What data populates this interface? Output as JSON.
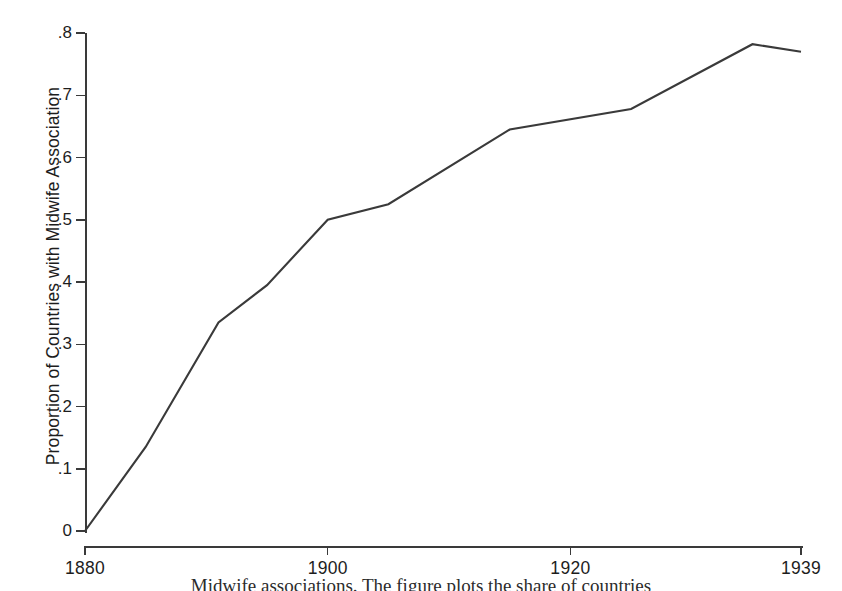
{
  "figure": {
    "background_color": "#ffffff",
    "line_color": "#3a3a3a",
    "axis_color": "#3a3a3a",
    "caption_partial": "Midwife associations. The figure plots the share of countries"
  },
  "chart_data": {
    "type": "line",
    "title": "",
    "xlabel": "",
    "ylabel": "Proportion of Countries with Midwife Association",
    "xlim": [
      1880,
      1939
    ],
    "ylim": [
      0,
      0.8
    ],
    "grid": false,
    "legend": null,
    "x_tick_labels": [
      "1880",
      "1900",
      "1920",
      "1939"
    ],
    "x_tick_values": [
      1880,
      1900,
      1920,
      1939
    ],
    "y_tick_labels": [
      "0",
      ".1",
      ".2",
      ".3",
      ".4",
      ".5",
      ".6",
      ".7",
      ".8"
    ],
    "y_tick_values": [
      0,
      0.1,
      0.2,
      0.3,
      0.4,
      0.5,
      0.6,
      0.7,
      0.8
    ],
    "series": [
      {
        "name": "Proportion of countries with midwife association",
        "x": [
          1880,
          1885,
          1891,
          1895,
          1900,
          1905,
          1915,
          1925,
          1935,
          1939
        ],
        "values": [
          0.0,
          0.135,
          0.335,
          0.395,
          0.5,
          0.525,
          0.645,
          0.678,
          0.782,
          0.77
        ]
      }
    ]
  }
}
